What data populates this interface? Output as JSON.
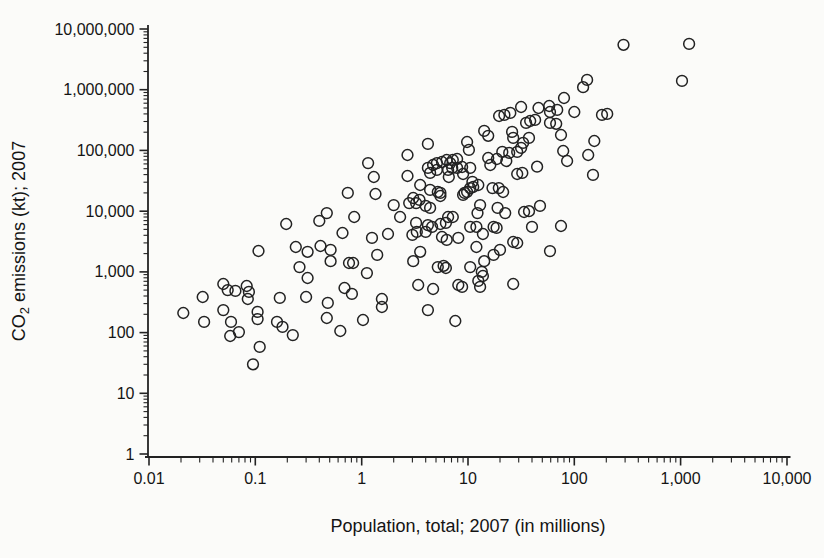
{
  "figure": {
    "background": "#fbfbf9",
    "ink_color": "#222222",
    "marker": {
      "shape": "open-circle",
      "radius_px": 5.4,
      "stroke": "#222222"
    }
  },
  "chart_data": {
    "type": "scatter",
    "title": "",
    "xlabel": "Population, total; 2007 (in millions)",
    "ylabel": "CO2 emissions (kt); 2007",
    "ylabel_prefix": "CO",
    "ylabel_sub": "2",
    "ylabel_suffix": " emissions (kt); 2007",
    "x_scale": "log",
    "y_scale": "log",
    "xlim": [
      0.01,
      10000
    ],
    "ylim": [
      1,
      10000000
    ],
    "grid": false,
    "legend": "none",
    "x_tick_values": [
      0.01,
      0.1,
      1,
      10,
      100,
      1000,
      10000
    ],
    "x_tick_labels": [
      "0.01",
      "0.1",
      "1",
      "10",
      "100",
      "1,000",
      "10,000"
    ],
    "y_tick_values": [
      1,
      10,
      100,
      1000,
      10000,
      100000,
      1000000,
      10000000
    ],
    "y_tick_labels": [
      "1",
      "10",
      "100",
      "1,000",
      "10,000",
      "100,000",
      "1,000,000",
      "10,000,000"
    ],
    "points": [
      [
        290,
        5500000
      ],
      [
        1200,
        5700000
      ],
      [
        1030,
        1400000
      ],
      [
        132,
        1450000
      ],
      [
        121,
        1100000
      ],
      [
        80,
        730000
      ],
      [
        31.6,
        520000
      ],
      [
        46,
        500000
      ],
      [
        58,
        540000
      ],
      [
        59,
        430000
      ],
      [
        69,
        465000
      ],
      [
        100,
        430000
      ],
      [
        22,
        385000
      ],
      [
        19.6,
        370000
      ],
      [
        25,
        415000
      ],
      [
        38.5,
        306000
      ],
      [
        42.8,
        318000
      ],
      [
        35.2,
        284000
      ],
      [
        59,
        284000
      ],
      [
        67.6,
        275000
      ],
      [
        182,
        385000
      ],
      [
        204,
        400000
      ],
      [
        14.2,
        210000
      ],
      [
        15.5,
        174000
      ],
      [
        26,
        202000
      ],
      [
        26.6,
        161000
      ],
      [
        75,
        180000
      ],
      [
        37.5,
        161000
      ],
      [
        33,
        133000
      ],
      [
        154,
        143000
      ],
      [
        31.6,
        110000
      ],
      [
        21,
        94500
      ],
      [
        24.4,
        91000
      ],
      [
        29,
        94500
      ],
      [
        78.6,
        98000
      ],
      [
        135,
        84000
      ],
      [
        85.6,
        67000
      ],
      [
        44.7,
        54000
      ],
      [
        15.5,
        75000
      ],
      [
        18.7,
        72400
      ],
      [
        22.9,
        67000
      ],
      [
        16.2,
        57500
      ],
      [
        1.15,
        62000
      ],
      [
        2.7,
        84000
      ],
      [
        4.2,
        128000
      ],
      [
        9.8,
        138000
      ],
      [
        10.2,
        102000
      ],
      [
        2.7,
        38000
      ],
      [
        3.55,
        27000
      ],
      [
        4.4,
        42600
      ],
      [
        4.2,
        51500
      ],
      [
        4.7,
        57500
      ],
      [
        5.1,
        62000
      ],
      [
        5.1,
        47800
      ],
      [
        5.7,
        64600
      ],
      [
        6.3,
        69700
      ],
      [
        6.8,
        62000
      ],
      [
        7.2,
        69700
      ],
      [
        7.9,
        72400
      ],
      [
        7.1,
        51500
      ],
      [
        6.5,
        47800
      ],
      [
        6.6,
        36500
      ],
      [
        7.9,
        51500
      ],
      [
        8.8,
        53400
      ],
      [
        9,
        41000
      ],
      [
        10.5,
        51500
      ],
      [
        11,
        30300
      ],
      [
        11.2,
        25000
      ],
      [
        9.8,
        20700
      ],
      [
        9,
        18500
      ],
      [
        5.2,
        20700
      ],
      [
        5.5,
        17800
      ],
      [
        3.5,
        15300
      ],
      [
        3.05,
        16500
      ],
      [
        4.4,
        11300
      ],
      [
        12.5,
        27000
      ],
      [
        1.3,
        36500
      ],
      [
        29,
        41000
      ],
      [
        32.4,
        42600
      ],
      [
        150,
        39500
      ],
      [
        10.5,
        24000
      ],
      [
        17,
        24000
      ],
      [
        21.4,
        20700
      ],
      [
        19.5,
        24000
      ],
      [
        4.4,
        22400
      ],
      [
        5.5,
        20000
      ],
      [
        9.3,
        20000
      ],
      [
        0.74,
        20000
      ],
      [
        1.35,
        19200
      ],
      [
        2,
        12600
      ],
      [
        2.8,
        13600
      ],
      [
        3.25,
        13600
      ],
      [
        4,
        12200
      ],
      [
        13,
        12600
      ],
      [
        12.3,
        9300
      ],
      [
        19,
        11300
      ],
      [
        22.4,
        9300
      ],
      [
        33.7,
        9700
      ],
      [
        37.5,
        10000
      ],
      [
        47.6,
        12200
      ],
      [
        0.47,
        9300
      ],
      [
        0.4,
        6900
      ],
      [
        0.85,
        8000
      ],
      [
        2.3,
        8000
      ],
      [
        3.25,
        6400
      ],
      [
        4.2,
        5900
      ],
      [
        6.5,
        8000
      ],
      [
        7.2,
        8000
      ],
      [
        5.5,
        6150
      ],
      [
        6.2,
        6400
      ],
      [
        0.195,
        6150
      ],
      [
        0.66,
        4370
      ],
      [
        1.25,
        3630
      ],
      [
        1.77,
        4200
      ],
      [
        3,
        4070
      ],
      [
        3.3,
        4550
      ],
      [
        4,
        4550
      ],
      [
        4.6,
        5500
      ],
      [
        5.7,
        3760
      ],
      [
        6.3,
        3360
      ],
      [
        8.1,
        3630
      ],
      [
        10.5,
        5500
      ],
      [
        12,
        5500
      ],
      [
        17.4,
        5500
      ],
      [
        18.6,
        5300
      ],
      [
        13.8,
        4200
      ],
      [
        40,
        5500
      ],
      [
        75,
        5700
      ],
      [
        12,
        2570
      ],
      [
        26.6,
        3100
      ],
      [
        29,
        2990
      ],
      [
        20,
        2300
      ],
      [
        17.4,
        1900
      ],
      [
        59,
        2200
      ],
      [
        14.2,
        1500
      ],
      [
        13.5,
        1000
      ],
      [
        13.8,
        855
      ],
      [
        12.5,
        710
      ],
      [
        13,
        565
      ],
      [
        26.6,
        632
      ],
      [
        10.5,
        1200
      ],
      [
        0.41,
        2670
      ],
      [
        0.51,
        2300
      ],
      [
        1.4,
        1900
      ],
      [
        3.55,
        2140
      ],
      [
        3.05,
        1500
      ],
      [
        0.76,
        1400
      ],
      [
        0.83,
        1400
      ],
      [
        0.51,
        1500
      ],
      [
        1.12,
        955
      ],
      [
        5.2,
        1200
      ],
      [
        5.9,
        1260
      ],
      [
        6.2,
        1160
      ],
      [
        3.4,
        608
      ],
      [
        4.7,
        522
      ],
      [
        0.69,
        543
      ],
      [
        0.81,
        433
      ],
      [
        0.48,
        308
      ],
      [
        1.55,
        358
      ],
      [
        1.55,
        264
      ],
      [
        4.2,
        235
      ],
      [
        8.1,
        608
      ],
      [
        8.8,
        565
      ],
      [
        0.107,
        2210
      ],
      [
        0.24,
        2570
      ],
      [
        0.31,
        2140
      ],
      [
        0.26,
        1200
      ],
      [
        0.31,
        794
      ],
      [
        0.05,
        632
      ],
      [
        0.055,
        500
      ],
      [
        0.065,
        485
      ],
      [
        0.083,
        586
      ],
      [
        0.087,
        468
      ],
      [
        0.085,
        358
      ],
      [
        0.032,
        386
      ],
      [
        0.05,
        235
      ],
      [
        0.17,
        372
      ],
      [
        0.3,
        386
      ],
      [
        0.021,
        210
      ],
      [
        0.105,
        219
      ],
      [
        0.105,
        167
      ],
      [
        0.033,
        150
      ],
      [
        0.059,
        150
      ],
      [
        0.16,
        150
      ],
      [
        0.18,
        124
      ],
      [
        0.058,
        88
      ],
      [
        0.07,
        102
      ],
      [
        0.11,
        58
      ],
      [
        0.095,
        30
      ],
      [
        0.225,
        91
      ],
      [
        0.63,
        106
      ],
      [
        0.47,
        174
      ],
      [
        1.03,
        161
      ],
      [
        7.6,
        155
      ]
    ]
  }
}
